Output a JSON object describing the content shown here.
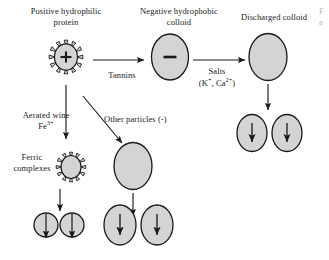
{
  "figure": {
    "background_color": "#ffffff",
    "particle_fill": "#d4d4d4",
    "particle_stroke": "#1a1a1a",
    "text_color": "#1a1a1a"
  },
  "labels": {
    "positive_protein_line1": "Positive hydrophilic",
    "positive_protein_line2": "protein",
    "negative_colloid_line1": "Negative hydrophobic",
    "negative_colloid_line2": "colloid",
    "discharged_colloid": "Discharged colloid",
    "tannins": "Tannins",
    "salts": "Salts",
    "salts_ions_pre": "(K",
    "salts_ions_sup1": "+",
    "salts_ions_mid": ", Ca",
    "salts_ions_sup2": "2+",
    "salts_ions_post": ")",
    "aerated_wine": "Aerated wine",
    "aerated_wine_ion_pre": "Fe",
    "aerated_wine_ion_sup": "3+",
    "other_particles": "Other particles (-)",
    "ferric_line1": "Ferric",
    "ferric_line2": "complexes"
  },
  "particles": {
    "positive_protein": {
      "charge_symbol": "+",
      "spiked": true
    },
    "negative_colloid": {
      "charge_symbol": "–",
      "spiked": false
    },
    "discharged_colloid": {
      "charge_symbol": "",
      "spiked": false
    },
    "ferric_complex": {
      "charge_symbol": "",
      "spiked": true
    },
    "settling_symbol": "down-arrow"
  },
  "edge_fragment": {
    "line1": "F",
    "line2": "a"
  }
}
